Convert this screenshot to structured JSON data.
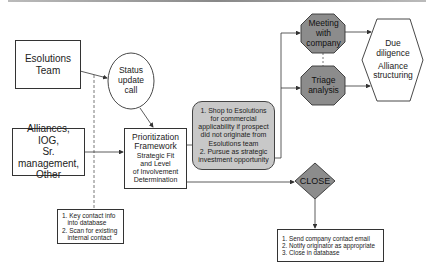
{
  "colors": {
    "line": "#333333",
    "octagon_fill": "#8c8c8c",
    "diamond_fill": "#8c8c8c",
    "rounded_box_fill": "#c8c8c8",
    "background": "#ffffff"
  },
  "nodes": {
    "esolutions_team": {
      "lines": [
        "Esolutions",
        "Team"
      ]
    },
    "status_call": {
      "lines": [
        "Status",
        "update",
        "call"
      ]
    },
    "alliances": {
      "lines": [
        "Alliances,",
        "IOG,",
        "Sr. management,",
        "Other"
      ]
    },
    "prioritization": {
      "title_lines": [
        "Prioritization",
        "Framework"
      ],
      "sub_lines": [
        "Strategic Fit",
        "and Level",
        "of Involvement",
        "Determination"
      ]
    },
    "shop_pursue": {
      "lines": [
        "1. Shop to Esolutions",
        "for commercial",
        "applicability if prospect",
        "did not originate from",
        "Esolutions team",
        "2. Pursue as strategic",
        "investment opportunity"
      ]
    },
    "meeting": {
      "lines": [
        "Meeting",
        "with",
        "company"
      ]
    },
    "triage": {
      "lines": [
        "Triage",
        "analysis"
      ]
    },
    "due_diligence": {
      "lines": [
        "Due",
        "diligence",
        "Alliance",
        "structuring"
      ]
    },
    "close": {
      "label": "CLOSE"
    },
    "key_contact": {
      "lines": [
        "1. Key contact info",
        "   into database",
        "2. Scan for existing",
        "   internal contact"
      ]
    },
    "close_steps": {
      "lines": [
        "1. Send company contact email",
        "2. Notify originator as appropriate",
        "3. Close in database"
      ]
    }
  }
}
